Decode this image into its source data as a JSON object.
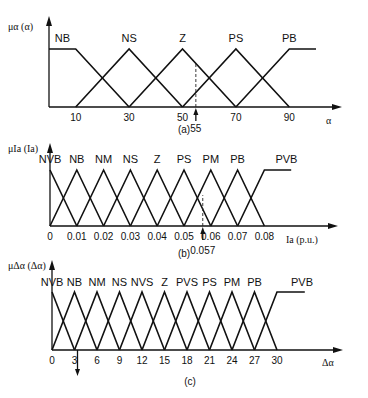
{
  "chart_data": [
    {
      "type": "line",
      "subtype": "fuzzy-membership",
      "caption": "(a)",
      "ylabel": "μα (α)",
      "xlabel": "α",
      "x_ticks": [
        10,
        30,
        50,
        70,
        90
      ],
      "marker": {
        "value": 55,
        "label": "55",
        "dashed": true,
        "arrow": "up"
      },
      "sets": [
        {
          "name": "NB",
          "shape": "left-shoulder",
          "points": [
            [
              0,
              1
            ],
            [
              10,
              1
            ],
            [
              30,
              0
            ]
          ]
        },
        {
          "name": "NS",
          "shape": "triangle",
          "points": [
            [
              10,
              0
            ],
            [
              30,
              1
            ],
            [
              50,
              0
            ]
          ]
        },
        {
          "name": "Z",
          "shape": "triangle",
          "points": [
            [
              30,
              0
            ],
            [
              50,
              1
            ],
            [
              70,
              0
            ]
          ]
        },
        {
          "name": "PS",
          "shape": "triangle",
          "points": [
            [
              50,
              0
            ],
            [
              70,
              1
            ],
            [
              90,
              0
            ]
          ]
        },
        {
          "name": "PB",
          "shape": "right-shoulder",
          "points": [
            [
              70,
              0
            ],
            [
              90,
              1
            ],
            [
              100,
              1
            ]
          ]
        }
      ],
      "ylim": [
        0,
        1
      ]
    },
    {
      "type": "line",
      "subtype": "fuzzy-membership",
      "caption": "(b)",
      "ylabel": "μIa (Ia)",
      "xlabel": "Ia (p.u.)",
      "x_ticks": [
        0,
        0.01,
        0.02,
        0.03,
        0.04,
        0.05,
        0.06,
        0.07,
        0.08
      ],
      "marker": {
        "value": 0.057,
        "label": "0.057",
        "dashed": true,
        "arrow": "up"
      },
      "sets": [
        {
          "name": "NVB",
          "shape": "triangle",
          "points": [
            [
              0,
              1
            ],
            [
              0.01,
              0
            ]
          ]
        },
        {
          "name": "NB",
          "shape": "triangle",
          "points": [
            [
              0,
              0
            ],
            [
              0.01,
              1
            ],
            [
              0.02,
              0
            ]
          ]
        },
        {
          "name": "NM",
          "shape": "triangle",
          "points": [
            [
              0.01,
              0
            ],
            [
              0.02,
              1
            ],
            [
              0.03,
              0
            ]
          ]
        },
        {
          "name": "NS",
          "shape": "triangle",
          "points": [
            [
              0.02,
              0
            ],
            [
              0.03,
              1
            ],
            [
              0.04,
              0
            ]
          ]
        },
        {
          "name": "Z",
          "shape": "triangle",
          "points": [
            [
              0.03,
              0
            ],
            [
              0.04,
              1
            ],
            [
              0.05,
              0
            ]
          ]
        },
        {
          "name": "PS",
          "shape": "triangle",
          "points": [
            [
              0.04,
              0
            ],
            [
              0.05,
              1
            ],
            [
              0.06,
              0
            ]
          ]
        },
        {
          "name": "PM",
          "shape": "triangle",
          "points": [
            [
              0.05,
              0
            ],
            [
              0.06,
              1
            ],
            [
              0.07,
              0
            ]
          ]
        },
        {
          "name": "PB",
          "shape": "triangle",
          "points": [
            [
              0.06,
              0
            ],
            [
              0.07,
              1
            ],
            [
              0.08,
              0
            ]
          ]
        },
        {
          "name": "PVB",
          "shape": "right-shoulder",
          "points": [
            [
              0.07,
              0
            ],
            [
              0.08,
              1
            ],
            [
              0.09,
              1
            ]
          ]
        }
      ],
      "ylim": [
        0,
        1
      ]
    },
    {
      "type": "line",
      "subtype": "fuzzy-membership",
      "caption": "(c)",
      "ylabel": "μΔα (Δα)",
      "xlabel": "Δα",
      "x_ticks": [
        0,
        3,
        6,
        9,
        12,
        15,
        18,
        21,
        24,
        27,
        30
      ],
      "marker": {
        "value": 3,
        "label": "",
        "dashed": false,
        "arrow": "down"
      },
      "sets": [
        {
          "name": "NVB",
          "shape": "triangle",
          "points": [
            [
              0,
              1
            ],
            [
              3,
              0
            ]
          ]
        },
        {
          "name": "NB",
          "shape": "triangle",
          "points": [
            [
              0,
              0
            ],
            [
              3,
              1
            ],
            [
              6,
              0
            ]
          ]
        },
        {
          "name": "NM",
          "shape": "triangle",
          "points": [
            [
              3,
              0
            ],
            [
              6,
              1
            ],
            [
              9,
              0
            ]
          ]
        },
        {
          "name": "NS",
          "shape": "triangle",
          "points": [
            [
              6,
              0
            ],
            [
              9,
              1
            ],
            [
              12,
              0
            ]
          ]
        },
        {
          "name": "NVS",
          "shape": "triangle",
          "points": [
            [
              9,
              0
            ],
            [
              12,
              1
            ],
            [
              15,
              0
            ]
          ]
        },
        {
          "name": "Z",
          "shape": "triangle",
          "points": [
            [
              12,
              0
            ],
            [
              15,
              1
            ],
            [
              18,
              0
            ]
          ]
        },
        {
          "name": "PVS",
          "shape": "triangle",
          "points": [
            [
              15,
              0
            ],
            [
              18,
              1
            ],
            [
              21,
              0
            ]
          ]
        },
        {
          "name": "PS",
          "shape": "triangle",
          "points": [
            [
              18,
              0
            ],
            [
              21,
              1
            ],
            [
              24,
              0
            ]
          ]
        },
        {
          "name": "PM",
          "shape": "triangle",
          "points": [
            [
              21,
              0
            ],
            [
              24,
              1
            ],
            [
              27,
              0
            ]
          ]
        },
        {
          "name": "PB",
          "shape": "triangle",
          "points": [
            [
              24,
              0
            ],
            [
              27,
              1
            ],
            [
              30,
              0
            ]
          ]
        },
        {
          "name": "PVB",
          "shape": "right-shoulder",
          "points": [
            [
              27,
              0
            ],
            [
              30,
              1
            ],
            [
              33.7,
              1
            ]
          ]
        }
      ],
      "ylim": [
        0,
        1
      ]
    }
  ]
}
